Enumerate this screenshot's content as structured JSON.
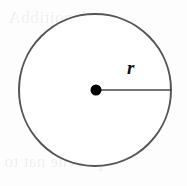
{
  "figure": {
    "name": "circle-with-radius",
    "type": "geometry-diagram",
    "width": 187,
    "height": 186,
    "background_color": "#fdfdfd"
  },
  "diagram": {
    "circle": {
      "center_x": 95,
      "center_y": 90,
      "radius": 76,
      "stroke_color": "#555555",
      "stroke_width": 2,
      "fill_color": "#ffffff"
    },
    "center_point": {
      "x": 96,
      "y": 90,
      "dot_radius": 5.5,
      "color": "#000000"
    },
    "radius_segment": {
      "x1": 96,
      "y1": 90,
      "x2": 171,
      "y2": 90,
      "stroke_color": "#4a4a4a",
      "stroke_width": 1.5
    },
    "radius_label": {
      "text": "r",
      "x": 133,
      "y": 70,
      "color": "#111111"
    }
  },
  "bleed_through": {
    "top_text": "lenoitibbA",
    "bottom_text": "qolevne nat to"
  }
}
